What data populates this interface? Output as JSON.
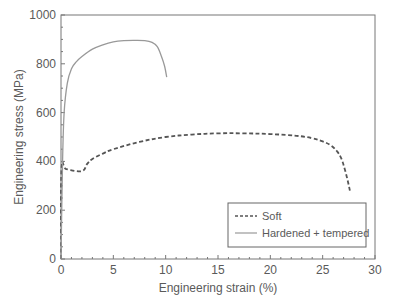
{
  "chart_data": {
    "type": "line",
    "title": "",
    "xlabel": "Engineering strain (%)",
    "ylabel": "Engineering stress (MPa)",
    "xlim": [
      0,
      30
    ],
    "ylim": [
      0,
      1000
    ],
    "x_ticks": [
      0,
      5,
      10,
      15,
      20,
      25,
      30
    ],
    "y_ticks": [
      0,
      200,
      400,
      600,
      800,
      1000
    ],
    "grid": false,
    "legend_position": "lower right",
    "series": [
      {
        "name": "Soft",
        "style": "dashed",
        "color": "#555555",
        "x": [
          0,
          0.05,
          0.5,
          2.0,
          2.5,
          3.0,
          4.0,
          5.0,
          7.5,
          10.0,
          12.5,
          15.0,
          17.5,
          20.0,
          22.5,
          24.0,
          25.0,
          25.8,
          26.4,
          26.8,
          27.1,
          27.4,
          27.6
        ],
        "y": [
          0,
          370,
          368,
          360,
          390,
          410,
          432,
          450,
          480,
          500,
          510,
          515,
          515,
          512,
          505,
          495,
          482,
          465,
          440,
          410,
          370,
          320,
          280
        ]
      },
      {
        "name": "Hardened + tempered",
        "style": "solid",
        "color": "#999999",
        "x": [
          0,
          0.15,
          0.3,
          0.6,
          1.0,
          1.5,
          2.0,
          3.0,
          4.0,
          5.0,
          6.0,
          7.0,
          8.0,
          8.7,
          9.2,
          9.6,
          9.9,
          10.1
        ],
        "y": [
          0,
          400,
          600,
          720,
          780,
          810,
          830,
          860,
          878,
          890,
          895,
          896,
          895,
          888,
          870,
          830,
          790,
          745
        ]
      }
    ]
  },
  "axes": {
    "x_title": "Engineering strain (%)",
    "y_title": "Engineering stress (MPa)",
    "x_tick_labels": [
      "0",
      "5",
      "10",
      "15",
      "20",
      "25",
      "30"
    ],
    "y_tick_labels": [
      "0",
      "200",
      "400",
      "600",
      "800",
      "1000"
    ]
  },
  "legend": {
    "items": [
      {
        "label": "Soft",
        "style": "dashed"
      },
      {
        "label": "Hardened + tempered",
        "style": "solid"
      }
    ]
  }
}
